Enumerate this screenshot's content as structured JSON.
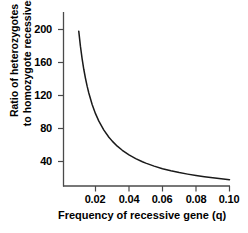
{
  "chart_data": {
    "type": "line",
    "title": "",
    "xlabel": "Frequency of recessive gene (q)",
    "ylabel_line1": "Ratio of heterozygotes",
    "ylabel_line2": "to homozygote recessives",
    "ylabel": "Ratio of heterozygotes to homozygote recessives",
    "xlim": [
      0.0,
      0.105
    ],
    "ylim": [
      0,
      215
    ],
    "xticks": [
      "0.02",
      "0.04",
      "0.06",
      "0.08",
      "0.10"
    ],
    "xtick_values": [
      0.02,
      0.04,
      0.06,
      0.08,
      0.1
    ],
    "yticks": [
      "200",
      "160",
      "120",
      "80",
      "40"
    ],
    "ytick_values": [
      200,
      160,
      120,
      80,
      40
    ],
    "grid": false,
    "legend": "none",
    "line_color": "#1a1a1a",
    "axis_color": "#4a4a4a",
    "background": "#ffffff",
    "series": [
      {
        "name": "heterozygote to homozygote recessive ratio",
        "formula": "2(1-q)/q",
        "x": [
          0.01,
          0.011,
          0.012,
          0.013,
          0.014,
          0.015,
          0.016,
          0.018,
          0.02,
          0.022,
          0.025,
          0.028,
          0.03,
          0.033,
          0.036,
          0.04,
          0.044,
          0.048,
          0.05,
          0.055,
          0.06,
          0.065,
          0.07,
          0.075,
          0.08,
          0.085,
          0.09,
          0.095,
          0.1
        ],
        "y": [
          198.0,
          179.8,
          164.7,
          151.8,
          140.9,
          131.3,
          123.0,
          109.1,
          98.0,
          88.9,
          78.0,
          69.4,
          64.7,
          58.6,
          53.6,
          48.0,
          43.5,
          39.7,
          38.0,
          34.4,
          31.3,
          28.8,
          26.6,
          24.7,
          23.0,
          21.5,
          20.2,
          19.1,
          18.0
        ]
      }
    ]
  }
}
